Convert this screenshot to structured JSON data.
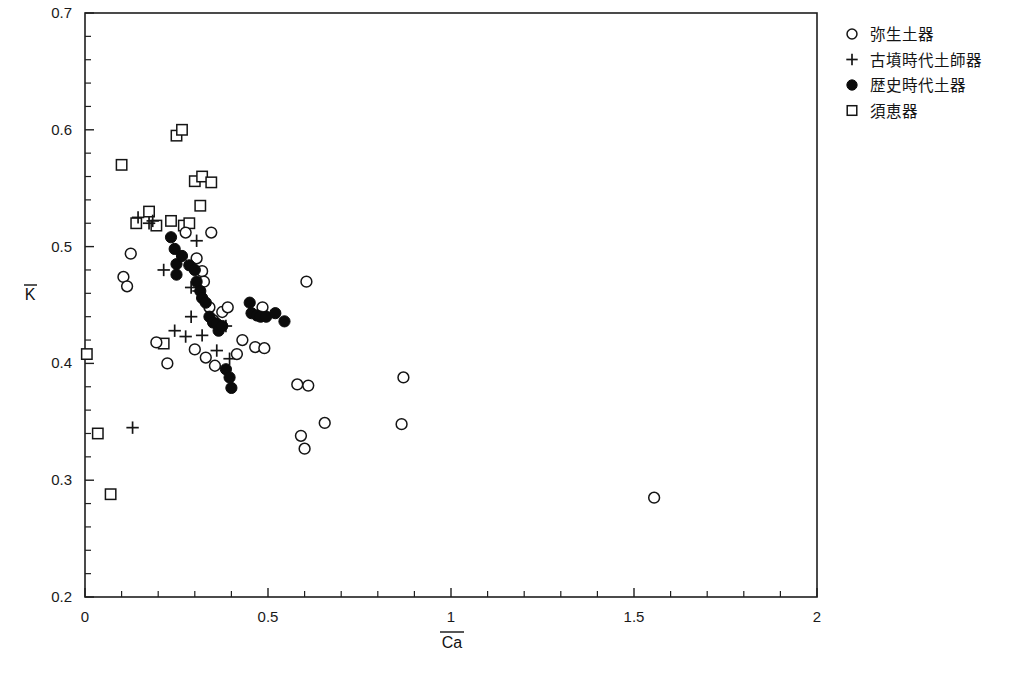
{
  "chart_data": {
    "type": "scatter",
    "title": "",
    "xlabel": "Ca",
    "xlabel_overbar": true,
    "ylabel": "K",
    "ylabel_overbar": true,
    "xlim": [
      0,
      2
    ],
    "ylim": [
      0.2,
      0.7
    ],
    "grid": false,
    "legend_position": "right",
    "x_ticks_major": [
      0,
      0.5,
      1,
      1.5,
      2
    ],
    "x_tick_labels": [
      "0",
      "0.5",
      "1",
      "1.5",
      "2"
    ],
    "x_ticks_minor_step": 0.1,
    "y_ticks_major": [
      0.2,
      0.3,
      0.4,
      0.5,
      0.6,
      0.7
    ],
    "y_tick_labels": [
      "0.2",
      "0.3",
      "0.4",
      "0.5",
      "0.6",
      "0.7"
    ],
    "y_ticks_minor_step": 0.02,
    "series": [
      {
        "name": "弥生土器",
        "marker": "open-circle",
        "color": "#151515",
        "points": [
          [
            0.105,
            0.474
          ],
          [
            0.125,
            0.494
          ],
          [
            0.115,
            0.466
          ],
          [
            0.195,
            0.418
          ],
          [
            0.225,
            0.4
          ],
          [
            0.275,
            0.512
          ],
          [
            0.305,
            0.49
          ],
          [
            0.32,
            0.479
          ],
          [
            0.325,
            0.47
          ],
          [
            0.345,
            0.512
          ],
          [
            0.34,
            0.448
          ],
          [
            0.35,
            0.437
          ],
          [
            0.375,
            0.444
          ],
          [
            0.39,
            0.448
          ],
          [
            0.3,
            0.412
          ],
          [
            0.33,
            0.405
          ],
          [
            0.355,
            0.398
          ],
          [
            0.415,
            0.408
          ],
          [
            0.43,
            0.42
          ],
          [
            0.465,
            0.414
          ],
          [
            0.49,
            0.413
          ],
          [
            0.485,
            0.448
          ],
          [
            0.605,
            0.47
          ],
          [
            0.58,
            0.382
          ],
          [
            0.61,
            0.381
          ],
          [
            0.59,
            0.338
          ],
          [
            0.6,
            0.327
          ],
          [
            0.655,
            0.349
          ],
          [
            0.865,
            0.348
          ],
          [
            0.87,
            0.388
          ],
          [
            1.555,
            0.285
          ]
        ]
      },
      {
        "name": "古墳時代土師器",
        "marker": "plus",
        "color": "#151515",
        "points": [
          [
            0.145,
            0.525
          ],
          [
            0.175,
            0.52
          ],
          [
            0.185,
            0.522
          ],
          [
            0.305,
            0.505
          ],
          [
            0.29,
            0.465
          ],
          [
            0.31,
            0.462
          ],
          [
            0.29,
            0.44
          ],
          [
            0.33,
            0.452
          ],
          [
            0.245,
            0.428
          ],
          [
            0.32,
            0.424
          ],
          [
            0.36,
            0.411
          ],
          [
            0.385,
            0.432
          ],
          [
            0.395,
            0.404
          ],
          [
            0.13,
            0.345
          ],
          [
            0.215,
            0.48
          ],
          [
            0.275,
            0.423
          ]
        ]
      },
      {
        "name": "歴史時代土器",
        "marker": "filled-circle",
        "color": "#0b0b0b",
        "points": [
          [
            0.235,
            0.508
          ],
          [
            0.245,
            0.498
          ],
          [
            0.25,
            0.485
          ],
          [
            0.25,
            0.476
          ],
          [
            0.265,
            0.492
          ],
          [
            0.285,
            0.484
          ],
          [
            0.3,
            0.48
          ],
          [
            0.305,
            0.47
          ],
          [
            0.315,
            0.462
          ],
          [
            0.32,
            0.456
          ],
          [
            0.33,
            0.452
          ],
          [
            0.34,
            0.44
          ],
          [
            0.35,
            0.435
          ],
          [
            0.36,
            0.434
          ],
          [
            0.365,
            0.428
          ],
          [
            0.375,
            0.432
          ],
          [
            0.385,
            0.395
          ],
          [
            0.395,
            0.388
          ],
          [
            0.4,
            0.379
          ],
          [
            0.455,
            0.443
          ],
          [
            0.47,
            0.441
          ],
          [
            0.48,
            0.44
          ],
          [
            0.495,
            0.44
          ],
          [
            0.52,
            0.443
          ],
          [
            0.545,
            0.436
          ],
          [
            0.45,
            0.452
          ]
        ]
      },
      {
        "name": "須恵器",
        "marker": "open-square",
        "color": "#151515",
        "points": [
          [
            0.005,
            0.408
          ],
          [
            0.035,
            0.34
          ],
          [
            0.07,
            0.288
          ],
          [
            0.1,
            0.57
          ],
          [
            0.25,
            0.595
          ],
          [
            0.265,
            0.6
          ],
          [
            0.175,
            0.53
          ],
          [
            0.14,
            0.52
          ],
          [
            0.195,
            0.518
          ],
          [
            0.235,
            0.522
          ],
          [
            0.27,
            0.518
          ],
          [
            0.285,
            0.52
          ],
          [
            0.3,
            0.556
          ],
          [
            0.32,
            0.56
          ],
          [
            0.345,
            0.555
          ],
          [
            0.315,
            0.535
          ],
          [
            0.215,
            0.417
          ]
        ]
      }
    ]
  },
  "legend": {
    "items": [
      {
        "marker": "open-circle",
        "label": "弥生土器"
      },
      {
        "marker": "plus",
        "label": "古墳時代土師器"
      },
      {
        "marker": "filled-circle",
        "label": "歴史時代土器"
      },
      {
        "marker": "open-square",
        "label": "須恵器"
      }
    ]
  },
  "axes": {
    "x_title": "Ca",
    "y_title": "K"
  }
}
